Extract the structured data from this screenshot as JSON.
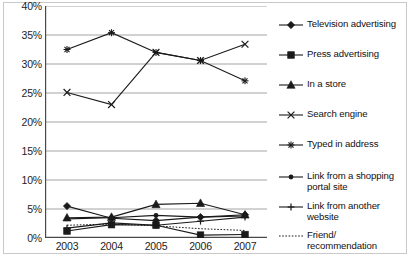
{
  "chart_data": {
    "type": "line",
    "title": "",
    "xlabel": "",
    "ylabel": "",
    "categories": [
      "2003",
      "2004",
      "2005",
      "2006",
      "2007"
    ],
    "x": [
      2003,
      2004,
      2005,
      2006,
      2007
    ],
    "ylim": [
      0,
      40
    ],
    "ytick_labels": [
      "0%",
      "5%",
      "10%",
      "15%",
      "20%",
      "25%",
      "30%",
      "35%",
      "40%"
    ],
    "ytick_values": [
      0,
      5,
      10,
      15,
      20,
      25,
      30,
      35,
      40
    ],
    "grid": "horizontal",
    "legend_position": "right",
    "value_suffix": "%",
    "series": [
      {
        "name": "Television advertising",
        "marker": "diamond",
        "line": "solid",
        "values": [
          5.5,
          3.4,
          3.0,
          3.6,
          4.0
        ]
      },
      {
        "name": "Press advertising",
        "marker": "square",
        "line": "solid",
        "values": [
          1.2,
          2.3,
          2.2,
          0.5,
          0.6
        ]
      },
      {
        "name": "In a store",
        "marker": "triangle",
        "line": "solid",
        "values": [
          3.5,
          3.6,
          5.8,
          6.0,
          4.0
        ]
      },
      {
        "name": "Search engine",
        "marker": "cross",
        "line": "solid",
        "values": [
          25.1,
          23.0,
          32.0,
          30.6,
          33.4
        ]
      },
      {
        "name": "Typed in address",
        "marker": "asterisk",
        "line": "solid",
        "values": [
          32.5,
          35.4,
          32.0,
          30.6,
          27.1
        ]
      },
      {
        "name": "Link from a shopping portal site",
        "marker": "circle",
        "line": "solid",
        "values": [
          3.3,
          3.5,
          3.9,
          3.6,
          3.8
        ]
      },
      {
        "name": "Link from another website",
        "marker": "plus",
        "line": "solid",
        "values": [
          1.7,
          2.6,
          2.2,
          2.9,
          3.6
        ]
      },
      {
        "name": "Friend/ recommendation",
        "marker": "none",
        "line": "dotted",
        "values": [
          2.2,
          2.4,
          2.1,
          1.6,
          1.3
        ]
      }
    ]
  },
  "legend": {
    "items": [
      {
        "label": "Television advertising",
        "marker": "diamond",
        "line": "solid"
      },
      {
        "label": "Press advertising",
        "marker": "square",
        "line": "solid"
      },
      {
        "label": "In a store",
        "marker": "triangle",
        "line": "solid"
      },
      {
        "label": "Search engine",
        "marker": "cross",
        "line": "solid"
      },
      {
        "label": "Typed in address",
        "marker": "asterisk",
        "line": "solid"
      },
      {
        "label": "Link from a shopping portal site",
        "marker": "circle",
        "line": "solid"
      },
      {
        "label": "Link from another website",
        "marker": "plus",
        "line": "solid"
      },
      {
        "label": "Friend/ recommendation",
        "marker": "none",
        "line": "dotted"
      }
    ]
  },
  "colors": {
    "line": "#1a1a1a",
    "grid": "#9a9a9a",
    "axis": "#4a4a4a",
    "text": "#1d1d1d",
    "frame": "#c9c9c9"
  }
}
